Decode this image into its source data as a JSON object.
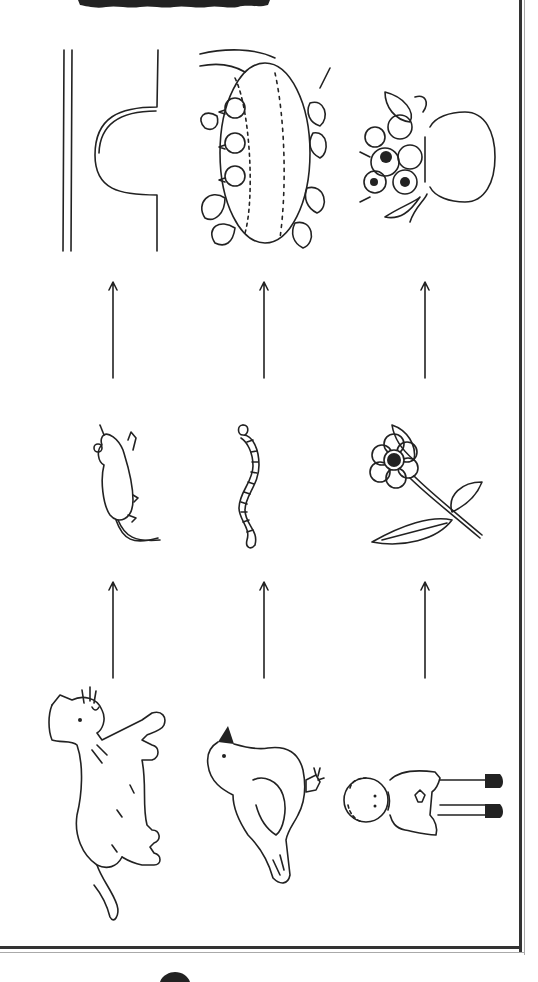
{
  "diagram": {
    "type": "food-chain-worksheet",
    "orientation": "rotated-90",
    "columns": [
      {
        "top": {
          "label": "mouse hole",
          "icon": "mouse-hole-icon"
        },
        "middle": {
          "label": "mouse",
          "icon": "mouse-icon"
        },
        "bottom": {
          "label": "cat",
          "icon": "cat-icon"
        }
      },
      {
        "top": {
          "label": "bird nest",
          "icon": "nest-icon"
        },
        "middle": {
          "label": "worm",
          "icon": "worm-icon"
        },
        "bottom": {
          "label": "bird",
          "icon": "bird-icon"
        }
      },
      {
        "top": {
          "label": "flower vase",
          "icon": "vase-icon"
        },
        "middle": {
          "label": "flower",
          "icon": "flower-icon"
        },
        "bottom": {
          "label": "boy",
          "icon": "boy-icon"
        }
      }
    ],
    "arrows": {
      "direction": "up",
      "rows": 2,
      "x_positions": [
        113,
        264,
        425
      ]
    },
    "colors": {
      "ink": "#222222",
      "background": "#ffffff",
      "border": "#333333"
    }
  }
}
